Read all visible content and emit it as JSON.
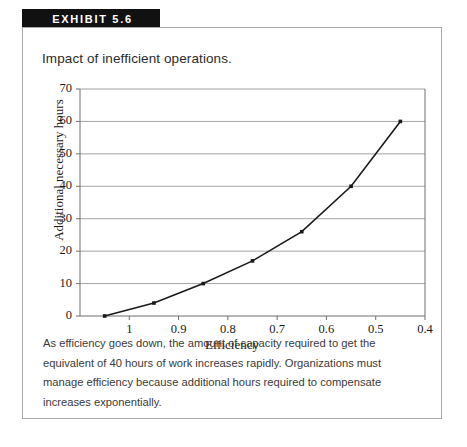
{
  "exhibit": {
    "label": "EXHIBIT 5.6"
  },
  "figure": {
    "title": "Impact of inefficient operations.",
    "caption": "As efficiency goes down, the amount of capacity required to get the equivalent of 40 hours of work increases rapidly. Organizations must manage efficiency because additional hours required to compensate increases exponentially."
  },
  "chart_data": {
    "type": "line",
    "title": "Impact of inefficient operations.",
    "xlabel": "Efficiency",
    "ylabel": "Additional necessary hours",
    "x": [
      1.05,
      0.95,
      0.85,
      0.75,
      0.65,
      0.55,
      0.45
    ],
    "values": [
      0,
      4,
      10,
      17,
      26,
      40,
      60
    ],
    "series": [
      {
        "name": "Additional necessary hours",
        "values": [
          0,
          4,
          10,
          17,
          26,
          40,
          60
        ]
      }
    ],
    "xlim": [
      1.1,
      0.4
    ],
    "ylim": [
      0,
      70
    ],
    "x_reversed": true,
    "xticks": [
      1,
      0.9,
      0.8,
      0.7,
      0.6,
      0.5,
      0.4
    ],
    "xtick_labels": [
      "1",
      "0.9",
      "0.8",
      "0.7",
      "0.6",
      "0.5",
      "0.4"
    ],
    "yticks": [
      0,
      10,
      20,
      30,
      40,
      50,
      60,
      70
    ],
    "ytick_labels": [
      "0",
      "10",
      "20",
      "30",
      "40",
      "50",
      "60",
      "70"
    ],
    "grid": "horizontal",
    "legend": "none",
    "line_color": "#1a1a1a",
    "marker": "square",
    "grid_color": "#9a9a9a"
  }
}
